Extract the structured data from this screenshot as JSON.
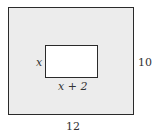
{
  "diagram": {
    "outer_rect": {
      "width_label": "12",
      "height_label": "10",
      "fill": "#ececec"
    },
    "inner_rect": {
      "width_label": "x + 2",
      "height_label": "x",
      "fill": "#ffffff"
    }
  }
}
